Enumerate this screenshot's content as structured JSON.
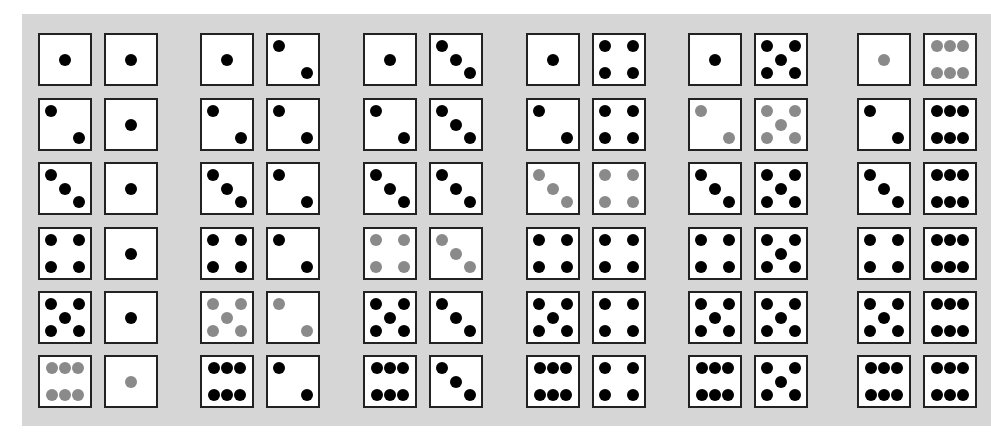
{
  "figure": {
    "background_color": "#d6d6d6",
    "pip_color": "#000000",
    "highlight_pip_color": "#8a8a8a",
    "highlight_rule": "sum equals 7",
    "groups": [
      {
        "second_die": 1,
        "pairs": [
          [
            1,
            1,
            false
          ],
          [
            2,
            1,
            false
          ],
          [
            3,
            1,
            false
          ],
          [
            4,
            1,
            false
          ],
          [
            5,
            1,
            false
          ],
          [
            6,
            1,
            true
          ]
        ]
      },
      {
        "second_die": 2,
        "pairs": [
          [
            1,
            2,
            false
          ],
          [
            2,
            2,
            false
          ],
          [
            3,
            2,
            false
          ],
          [
            4,
            2,
            false
          ],
          [
            5,
            2,
            true
          ],
          [
            6,
            2,
            false
          ]
        ]
      },
      {
        "second_die": 3,
        "pairs": [
          [
            1,
            3,
            false
          ],
          [
            2,
            3,
            false
          ],
          [
            3,
            3,
            false
          ],
          [
            4,
            3,
            true
          ],
          [
            5,
            3,
            false
          ],
          [
            6,
            3,
            false
          ]
        ]
      },
      {
        "second_die": 4,
        "pairs": [
          [
            1,
            4,
            false
          ],
          [
            2,
            4,
            false
          ],
          [
            3,
            4,
            true
          ],
          [
            4,
            4,
            false
          ],
          [
            5,
            4,
            false
          ],
          [
            6,
            4,
            false
          ]
        ]
      },
      {
        "second_die": 5,
        "pairs": [
          [
            1,
            5,
            false
          ],
          [
            2,
            5,
            true
          ],
          [
            3,
            5,
            false
          ],
          [
            4,
            5,
            false
          ],
          [
            5,
            5,
            false
          ],
          [
            6,
            5,
            false
          ]
        ]
      },
      {
        "second_die": 6,
        "pairs": [
          [
            1,
            6,
            true
          ],
          [
            2,
            6,
            false
          ],
          [
            3,
            6,
            false
          ],
          [
            4,
            6,
            false
          ],
          [
            5,
            6,
            false
          ],
          [
            6,
            6,
            false
          ]
        ]
      }
    ]
  }
}
